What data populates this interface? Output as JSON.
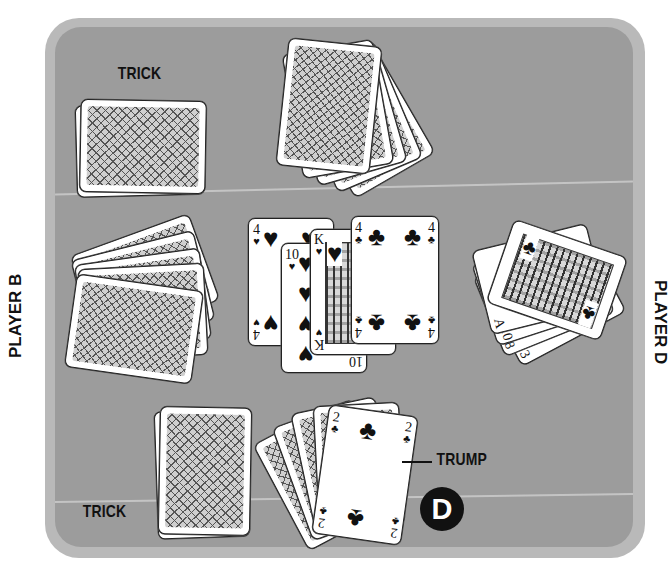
{
  "labels": {
    "trick_top": "TRICK",
    "trick_bottom": "TRICK",
    "trump": "TRUMP",
    "player_left": "PLAYER B",
    "player_right": "PLAYER D",
    "dealer_marker": "D"
  },
  "colors": {
    "table_outer": "#b9b9b9",
    "table_inner": "#9c9c9c",
    "card_face": "#ffffff",
    "ink": "#111111"
  },
  "center_trick": [
    {
      "rank": "4",
      "suit": "♥",
      "suit_name": "hearts"
    },
    {
      "rank": "10",
      "suit": "♥",
      "suit_name": "hearts"
    },
    {
      "rank": "K",
      "suit": "♥",
      "suit_name": "hearts"
    },
    {
      "rank": "4",
      "suit": "♣",
      "suit_name": "clubs"
    }
  ],
  "player_d_hand": [
    {
      "rank": "J",
      "suit": "♣"
    },
    {
      "rank": "A",
      "suit": "♣"
    },
    {
      "rank": "10",
      "suit": "♣"
    },
    {
      "rank": "8",
      "suit": "♣"
    },
    {
      "rank": "3",
      "suit": "♣"
    }
  ],
  "trump_card": {
    "rank": "2",
    "suit": "♣"
  },
  "hands": {
    "top_face_down_count": 5,
    "left_face_down_count": 5,
    "bottom_face_down_count": 4
  }
}
